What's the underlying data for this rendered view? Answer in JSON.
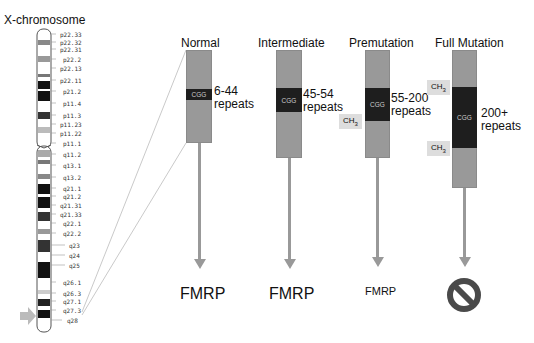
{
  "chromosome": {
    "title": "X-chromosome",
    "bands": [
      {
        "label": "p22.33",
        "y": 34
      },
      {
        "label": "p22.32",
        "y": 42
      },
      {
        "label": "p22.31",
        "y": 49
      },
      {
        "label": "p22.2",
        "y": 59
      },
      {
        "label": "p22.13",
        "y": 68
      },
      {
        "label": "p22.11",
        "y": 80
      },
      {
        "label": "p21.2",
        "y": 91
      },
      {
        "label": "p11.4",
        "y": 103
      },
      {
        "label": "p11.3",
        "y": 115
      },
      {
        "label": "p11.23",
        "y": 124
      },
      {
        "label": "p11.22",
        "y": 133
      },
      {
        "label": "p11.1",
        "y": 143
      },
      {
        "label": "q11.2",
        "y": 154
      },
      {
        "label": "q13.1",
        "y": 165
      },
      {
        "label": "q13.2",
        "y": 177
      },
      {
        "label": "q21.1",
        "y": 188
      },
      {
        "label": "q21.2",
        "y": 196
      },
      {
        "label": "q21.31",
        "y": 205
      },
      {
        "label": "q21.33",
        "y": 214
      },
      {
        "label": "q22.1",
        "y": 223
      },
      {
        "label": "q22.2",
        "y": 233
      },
      {
        "label": "q23",
        "y": 245
      },
      {
        "label": "q24",
        "y": 255
      },
      {
        "label": "q25",
        "y": 265
      },
      {
        "label": "q26.1",
        "y": 282
      },
      {
        "label": "q26.3",
        "y": 293
      },
      {
        "label": "q27.1",
        "y": 301
      },
      {
        "label": "q27.3",
        "y": 310
      },
      {
        "label": "q28",
        "y": 320
      }
    ],
    "marker": "arrow-right-icon"
  },
  "columns": [
    {
      "title": "Normal",
      "cgg": "CGG",
      "repeats_range": "6-44",
      "repeats_word": "repeats",
      "product": "FMRP",
      "methylation": []
    },
    {
      "title": "Intermediate",
      "cgg": "CGG",
      "repeats_range": "45-54",
      "repeats_word": "repeats",
      "product": "FMRP",
      "methylation": []
    },
    {
      "title": "Premutation",
      "cgg": "CGG",
      "repeats_range": "55-200",
      "repeats_word": "repeats",
      "product": "FMRP",
      "methylation": [
        "CH3"
      ]
    },
    {
      "title": "Full Mutation",
      "cgg": "CGG",
      "repeats_range": "200+",
      "repeats_word": "repeats",
      "product": "no-symbol-icon",
      "methylation": [
        "CH3",
        "CH3"
      ]
    }
  ],
  "colors": {
    "bar": "#999999",
    "cgg": "#1e1e1e",
    "ch3_bg": "#dddddd",
    "arrow": "#999999",
    "no_symbol": "#4a4a4a"
  }
}
